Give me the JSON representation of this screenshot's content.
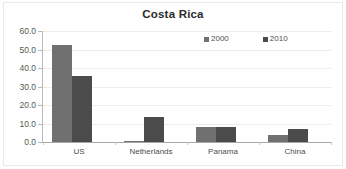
{
  "chart_data": {
    "type": "bar",
    "title": "Costa Rica",
    "xlabel": "",
    "ylabel": "",
    "categories": [
      "US",
      "Netherlands",
      "Panama",
      "China"
    ],
    "series": [
      {
        "name": "2000",
        "color": "#707070",
        "values": [
          52.5,
          0.3,
          8.0,
          4.0
        ]
      },
      {
        "name": "2010",
        "color": "#4b4b4b",
        "values": [
          35.5,
          13.3,
          8.0,
          7.0
        ]
      }
    ],
    "ylim": [
      0.0,
      60.0
    ],
    "ytick_labels": [
      "60.0",
      "50.0",
      "40.0",
      "30.0",
      "20.0",
      "10.0",
      "0.0"
    ],
    "ytick_values": [
      60.0,
      50.0,
      40.0,
      30.0,
      20.0,
      10.0,
      0.0
    ],
    "grid": true,
    "legend_position": "top-right",
    "legend_entries": [
      "2000",
      "2010"
    ]
  }
}
